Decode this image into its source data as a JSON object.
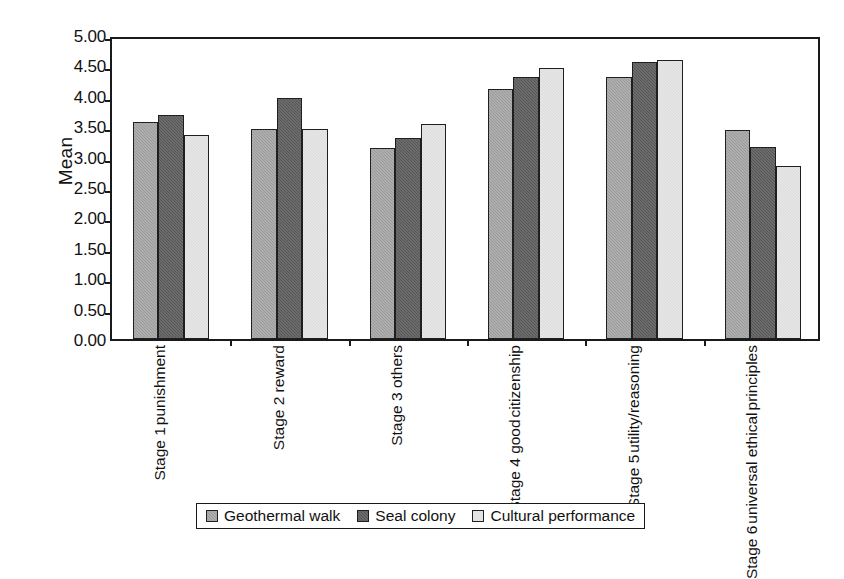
{
  "chart_data": {
    "type": "bar",
    "title": "",
    "xlabel": "",
    "ylabel": "Mean",
    "ylim": [
      0,
      5
    ],
    "ytick_step": 0.5,
    "yticks": [
      "0.00",
      "0.50",
      "1.00",
      "1.50",
      "2.00",
      "2.50",
      "3.00",
      "3.50",
      "4.00",
      "4.50",
      "5.00"
    ],
    "grid": false,
    "legend_position": "bottom",
    "categories": [
      {
        "line1": "Stage 1",
        "line2": "punishment"
      },
      {
        "line1": "Stage 2 reward",
        "line2": ""
      },
      {
        "line1": "Stage 3 others",
        "line2": ""
      },
      {
        "line1": "Stage 4 good",
        "line2": "citizenship"
      },
      {
        "line1": "Stage 5",
        "line2": "utility/reasoning"
      },
      {
        "line1": "Stage 6",
        "line2": "universal ethical",
        "line3": "principles"
      }
    ],
    "series": [
      {
        "name": "Geothermal walk",
        "color": "#9a9a9a",
        "values": [
          3.57,
          3.46,
          3.14,
          4.11,
          4.31,
          3.43
        ]
      },
      {
        "name": "Seal colony",
        "color": "#565656",
        "values": [
          3.68,
          3.96,
          3.3,
          4.31,
          4.56,
          3.15
        ]
      },
      {
        "name": "Cultural performance",
        "color": "#e9e9e9",
        "values": [
          3.35,
          3.46,
          3.54,
          4.46,
          4.59,
          2.85
        ]
      }
    ]
  },
  "legend": {
    "items": [
      {
        "label": "Geothermal walk"
      },
      {
        "label": "Seal colony"
      },
      {
        "label": "Cultural performance"
      }
    ]
  }
}
